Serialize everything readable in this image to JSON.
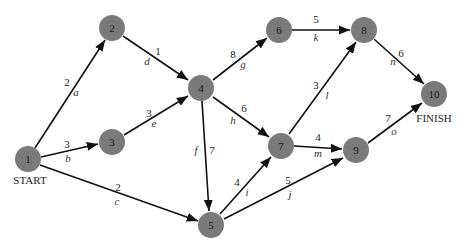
{
  "diagram": {
    "colors": {
      "node_fill": "#7a7a7a",
      "edge": "#111111",
      "background": "#ffffff"
    },
    "labels": {
      "start": "START",
      "finish": "FINISH"
    },
    "nodes": [
      {
        "id": "1",
        "x": 28,
        "y": 159
      },
      {
        "id": "2",
        "x": 112,
        "y": 28
      },
      {
        "id": "3",
        "x": 112,
        "y": 142
      },
      {
        "id": "4",
        "x": 201,
        "y": 88
      },
      {
        "id": "5",
        "x": 211,
        "y": 225
      },
      {
        "id": "6",
        "x": 279,
        "y": 30
      },
      {
        "id": "7",
        "x": 281,
        "y": 146
      },
      {
        "id": "8",
        "x": 364,
        "y": 30
      },
      {
        "id": "9",
        "x": 356,
        "y": 150
      },
      {
        "id": "10",
        "x": 434,
        "y": 94
      }
    ],
    "edges": [
      {
        "from": "1",
        "to": "2",
        "activity": "a",
        "duration": "2"
      },
      {
        "from": "1",
        "to": "3",
        "activity": "b",
        "duration": "3"
      },
      {
        "from": "1",
        "to": "5",
        "activity": "c",
        "duration": "2"
      },
      {
        "from": "2",
        "to": "4",
        "activity": "d",
        "duration": "1"
      },
      {
        "from": "3",
        "to": "4",
        "activity": "e",
        "duration": "3"
      },
      {
        "from": "4",
        "to": "5",
        "activity": "f",
        "duration": "7"
      },
      {
        "from": "4",
        "to": "6",
        "activity": "g",
        "duration": "8"
      },
      {
        "from": "4",
        "to": "7",
        "activity": "h",
        "duration": "6"
      },
      {
        "from": "5",
        "to": "7",
        "activity": "i",
        "duration": "4"
      },
      {
        "from": "5",
        "to": "9",
        "activity": "j",
        "duration": "5"
      },
      {
        "from": "6",
        "to": "8",
        "activity": "k",
        "duration": "5"
      },
      {
        "from": "7",
        "to": "8",
        "activity": "l",
        "duration": "3"
      },
      {
        "from": "7",
        "to": "9",
        "activity": "m",
        "duration": "4"
      },
      {
        "from": "8",
        "to": "10",
        "activity": "n",
        "duration": "6"
      },
      {
        "from": "9",
        "to": "10",
        "activity": "o",
        "duration": "7"
      }
    ]
  }
}
